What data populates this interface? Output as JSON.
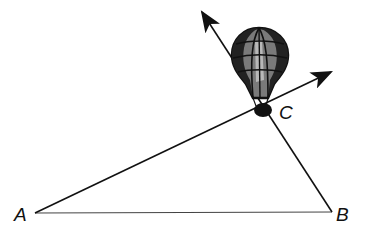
{
  "diagram": {
    "type": "geometry-triangle-with-hot-air-balloon",
    "points": {
      "A": {
        "label": "A",
        "x": 35,
        "y": 213
      },
      "B": {
        "label": "B",
        "x": 332,
        "y": 212
      },
      "C": {
        "label": "C",
        "x": 263,
        "y": 108
      }
    },
    "segments": [
      {
        "from": "A",
        "to": "B",
        "style": "thin"
      },
      {
        "from": "A",
        "to": "C",
        "extends_as_ray": true
      },
      {
        "from": "B",
        "to": "C",
        "extends_as_ray": true
      }
    ],
    "rays": [
      {
        "name": "ray-AC",
        "through": "C",
        "arrow_tip": {
          "x": 333,
          "y": 71
        }
      },
      {
        "name": "ray-BC",
        "through": "C",
        "arrow_tip": {
          "x": 200,
          "y": 10
        }
      }
    ],
    "object_at_C": "hot-air-balloon",
    "colors": {
      "line": "#111111",
      "balloon_dark": "#1a1a1a",
      "balloon_mid": "#6e6e6e",
      "balloon_light": "#bdbdbd"
    }
  }
}
